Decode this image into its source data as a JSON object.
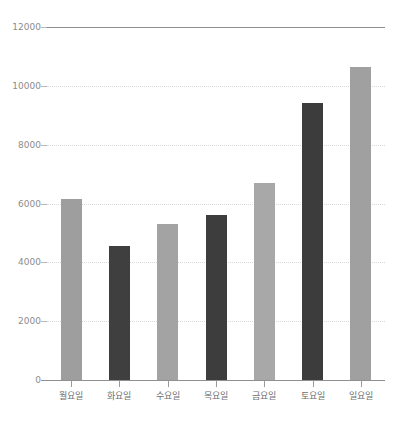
{
  "chart_data": {
    "type": "bar",
    "title": "",
    "subtitle": "",
    "xlabel": "",
    "ylabel": "",
    "categories": [
      "월요일",
      "화요일",
      "수요일",
      "목요일",
      "금요일",
      "토요일",
      "일요일"
    ],
    "values": [
      6150,
      4550,
      5300,
      5620,
      6700,
      9420,
      10650
    ],
    "series": [
      {
        "name": "",
        "values": [
          6150,
          4550,
          5300,
          5620,
          6700,
          9420,
          10650
        ]
      }
    ],
    "bar_colors": [
      "#9e9e9e",
      "#3f3f3f",
      "#a3a3a3",
      "#3d3d3d",
      "#a8a8a8",
      "#3c3c3c",
      "#a0a0a0"
    ],
    "ylim": [
      0,
      12000
    ],
    "ytick_values": [
      0,
      2000,
      4000,
      6000,
      8000,
      10000,
      12000
    ],
    "ytick_labels": [
      "0",
      "2000",
      "4000",
      "6000",
      "8000",
      "10000",
      "12000"
    ],
    "grid": true,
    "grid_style": "dotted",
    "grid_color": "#d8d8d8",
    "top_rule_color": "#8f8f8f",
    "axis_color": "#8f8f8f",
    "legend": null,
    "legend_position": "none",
    "annotations": [],
    "background_color": "#ffffff"
  }
}
